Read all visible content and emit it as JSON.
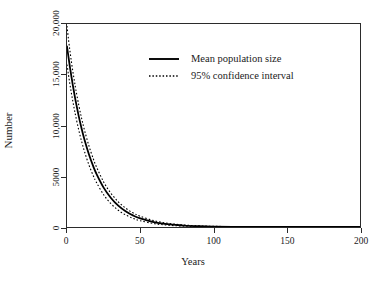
{
  "chart_data": {
    "type": "line",
    "title": "",
    "xlabel": "Years",
    "ylabel": "Number",
    "xlim": [
      0,
      200
    ],
    "ylim": [
      0,
      20000
    ],
    "xticks": [
      0,
      50,
      100,
      150,
      200
    ],
    "xtick_labels": [
      "0",
      "50",
      "100",
      "150",
      "200"
    ],
    "yticks": [
      0,
      5000,
      10000,
      15000,
      20000
    ],
    "ytick_labels": [
      "0",
      "5000",
      "10,000",
      "15,000",
      "20,000"
    ],
    "grid": false,
    "legend_position": "upper center",
    "legend": [
      {
        "label": "Mean population size",
        "style": "solid",
        "color": "#000000"
      },
      {
        "label": "95% confidence interval",
        "style": "dotted",
        "color": "#000000"
      }
    ],
    "x": [
      0,
      1,
      2,
      3,
      4,
      5,
      6,
      8,
      10,
      12,
      15,
      18,
      20,
      25,
      30,
      35,
      40,
      45,
      50,
      60,
      70,
      80,
      90,
      100,
      120,
      140,
      160,
      180,
      200
    ],
    "series": [
      {
        "name": "Mean population size",
        "style": "solid",
        "values": [
          17800,
          16750,
          15760,
          14830,
          13950,
          13130,
          12350,
          10930,
          9680,
          8570,
          7140,
          5950,
          5270,
          3880,
          2860,
          2100,
          1550,
          1140,
          840,
          455,
          248,
          134,
          73,
          40,
          12,
          4,
          1,
          0,
          0
        ]
      },
      {
        "name": "95% confidence interval upper",
        "style": "dotted",
        "values": [
          19800,
          18500,
          17350,
          16300,
          15320,
          14420,
          13570,
          12030,
          10690,
          9510,
          7980,
          6700,
          5960,
          4440,
          3320,
          2480,
          1860,
          1400,
          1055,
          600,
          345,
          200,
          118,
          70,
          26,
          10,
          4,
          2,
          1
        ]
      },
      {
        "name": "95% confidence interval lower",
        "style": "dotted",
        "values": [
          16000,
          15000,
          14070,
          13190,
          12370,
          11600,
          10880,
          9570,
          8420,
          7410,
          6100,
          5030,
          4420,
          3180,
          2290,
          1650,
          1190,
          855,
          616,
          320,
          166,
          86,
          45,
          23,
          6,
          2,
          0,
          0,
          0
        ]
      }
    ]
  },
  "axes": {
    "y_title": "Number",
    "x_title": "Years"
  }
}
